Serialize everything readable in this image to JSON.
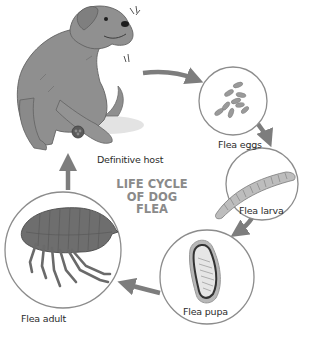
{
  "diagram": {
    "title": [
      "LIFE CYCLE",
      "OF DOG",
      "FLEA"
    ],
    "stages": [
      {
        "id": "host",
        "label": "Definitive host",
        "icon": "dog-scratching-icon"
      },
      {
        "id": "eggs",
        "label": "Flea eggs",
        "icon": "flea-eggs-icon"
      },
      {
        "id": "larva",
        "label": "Flea larva",
        "icon": "flea-larva-icon"
      },
      {
        "id": "pupa",
        "label": "Flea pupa",
        "icon": "flea-pupa-icon"
      },
      {
        "id": "adult",
        "label": "Flea adult",
        "icon": "flea-adult-icon"
      }
    ],
    "flow": [
      "host",
      "eggs",
      "larva",
      "pupa",
      "adult",
      "host"
    ],
    "colors": {
      "arrow": "#7d7d7d",
      "circle_stroke": "#8c8c8c",
      "title": "#8a8a8a",
      "dog_body": "#8f8f8f",
      "flea_body": "#6e6e6e",
      "text": "#2b2b2b"
    }
  }
}
